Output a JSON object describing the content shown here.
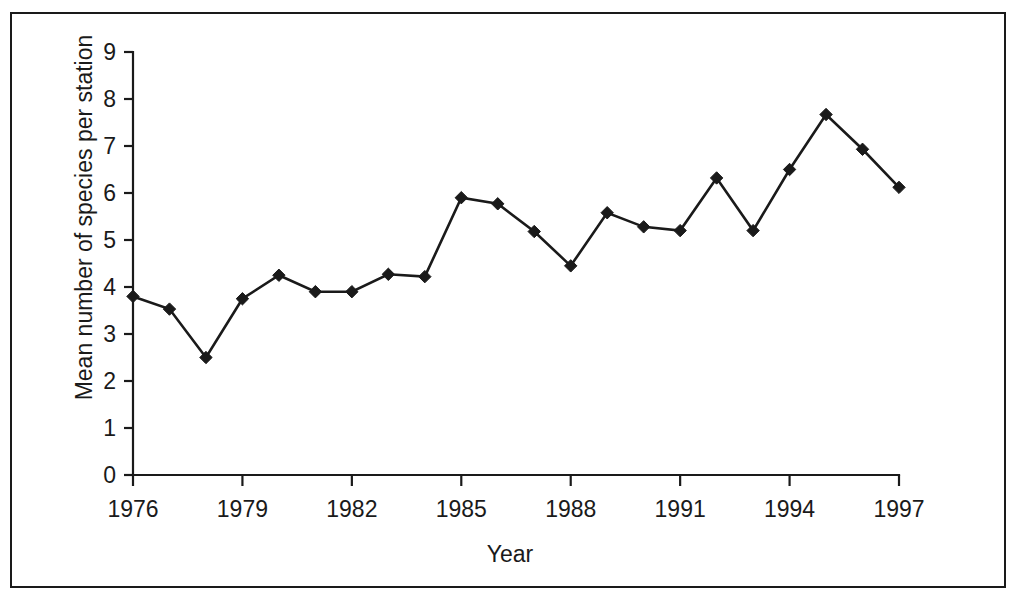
{
  "chart_data": {
    "type": "line",
    "title": "",
    "xlabel": "Year",
    "ylabel": "Mean number of species per station",
    "x": [
      1976,
      1977,
      1978,
      1979,
      1980,
      1981,
      1982,
      1983,
      1984,
      1985,
      1986,
      1987,
      1988,
      1989,
      1990,
      1991,
      1992,
      1993,
      1994,
      1995,
      1996,
      1997
    ],
    "values": [
      3.8,
      3.53,
      2.5,
      3.75,
      4.25,
      3.9,
      3.9,
      4.27,
      4.22,
      5.9,
      5.77,
      5.18,
      4.45,
      5.58,
      5.28,
      5.2,
      6.32,
      5.2,
      6.5,
      7.67,
      6.93,
      6.12
    ],
    "series": [
      {
        "name": "Mean number of species per station",
        "values": [
          3.8,
          3.53,
          2.5,
          3.75,
          4.25,
          3.9,
          3.9,
          4.27,
          4.22,
          5.9,
          5.77,
          5.18,
          4.45,
          5.58,
          5.28,
          5.2,
          6.32,
          5.2,
          6.5,
          7.67,
          6.93,
          6.12
        ]
      }
    ],
    "xlim": [
      1976,
      1997
    ],
    "ylim": [
      0,
      9
    ],
    "x_ticks": [
      1976,
      1979,
      1982,
      1985,
      1988,
      1991,
      1994,
      1997
    ],
    "x_tick_labels": [
      "1976",
      "1979",
      "1982",
      "1985",
      "1988",
      "1991",
      "1994",
      "1997"
    ],
    "y_ticks": [
      0,
      1,
      2,
      3,
      4,
      5,
      6,
      7,
      8,
      9
    ],
    "y_tick_labels": [
      "0",
      "1",
      "2",
      "3",
      "4",
      "5",
      "6",
      "7",
      "8",
      "9"
    ],
    "grid": false,
    "legend": false,
    "legend_position": "none",
    "marker": "diamond",
    "line_color": "#1a1a1a",
    "marker_color": "#1a1a1a",
    "background_color": "#ffffff",
    "frame_color": "#1a1a1a"
  }
}
